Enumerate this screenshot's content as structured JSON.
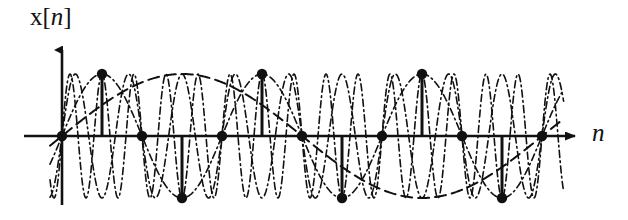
{
  "figure": {
    "kind": "discrete-time-signal-plot",
    "y_axis_label": "x[n]",
    "y_axis_label_parts": {
      "func": "x",
      "open": "[",
      "index": "n",
      "close": "]"
    },
    "x_axis_label": "n",
    "colors": {
      "ink": "#111111",
      "background": "#ffffff"
    }
  },
  "chart_data": {
    "type": "line",
    "title": "",
    "subtitle": "",
    "xlabel": "n",
    "ylabel": "x[n]",
    "xlim": [
      -0.35,
      12.6
    ],
    "ylim": [
      -1.45,
      1.45
    ],
    "grid": false,
    "legend": "none",
    "annotations": [],
    "stem": {
      "name": "x[n] samples",
      "marker": "filled-circle",
      "n": [
        0,
        1,
        2,
        3,
        4,
        5,
        6,
        7,
        8,
        9,
        10,
        11,
        12
      ],
      "values": [
        0,
        1,
        0,
        -1,
        0,
        1,
        0,
        -1,
        0,
        1,
        0,
        -1,
        0
      ],
      "sample_period_px": 40,
      "origin_px": {
        "x": 62,
        "y": 136
      },
      "amplitude_px": 62
    },
    "series": [
      {
        "name": "sinusoid-aliased-a",
        "style": "dash-dot",
        "stroke_width": 1.6,
        "cycles_per_sample": 0.25,
        "phase": 0,
        "amplitude": 1
      },
      {
        "name": "sinusoid-aliased-b",
        "style": "dash-dot",
        "stroke_width": 1.6,
        "cycles_per_sample": 0.75,
        "phase": 0,
        "amplitude": 1
      },
      {
        "name": "sinusoid-aliased-c",
        "style": "dash-dot",
        "stroke_width": 1.6,
        "cycles_per_sample": 1.25,
        "phase": 0,
        "amplitude": 1
      },
      {
        "name": "sinusoid-envelope-dashed",
        "style": "long-dash",
        "stroke_width": 2.0,
        "cycles_per_sample": 0.0833,
        "phase": 0,
        "amplitude": 1
      }
    ]
  }
}
